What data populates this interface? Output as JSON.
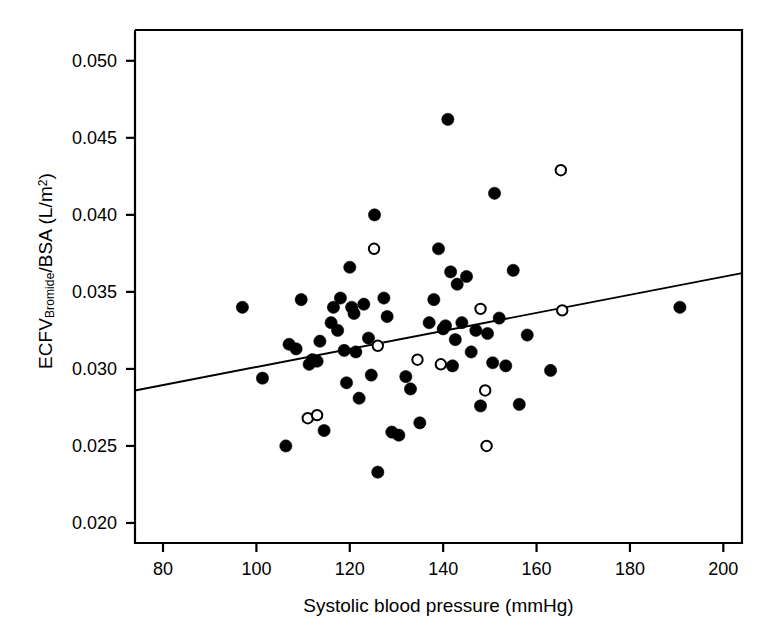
{
  "chart_data": {
    "type": "scatter",
    "title": "",
    "xlabel": "Systolic blood pressure (mmHg)",
    "ylabel_main": "ECFV",
    "ylabel_sub": "Bromide",
    "ylabel_mid": "/BSA (L/m",
    "ylabel_sup": "2",
    "ylabel_end": ")",
    "ylabel_plain": "ECFV_Bromide/BSA (L/m2)",
    "xlim": [
      74,
      204
    ],
    "ylim": [
      0.0187,
      0.052
    ],
    "xticks": [
      80,
      100,
      120,
      140,
      160,
      180,
      200
    ],
    "xticklabels": [
      "80",
      "100",
      "120",
      "140",
      "160",
      "180",
      "200"
    ],
    "yticks": [
      0.02,
      0.025,
      0.03,
      0.035,
      0.04,
      0.045,
      0.05
    ],
    "yticklabels": [
      "0.020",
      "0.025",
      "0.030",
      "0.035",
      "0.040",
      "0.045",
      "0.050"
    ],
    "grid": false,
    "legend": "none",
    "axis_color": "#000000",
    "marker_color": "#000000",
    "line_color": "#000000",
    "series": [
      {
        "name": "filled",
        "marker": "filled-circle",
        "points": [
          [
            97.0,
            0.034
          ],
          [
            101.3,
            0.0294
          ],
          [
            106.3,
            0.025
          ],
          [
            107.0,
            0.0316
          ],
          [
            108.5,
            0.0313
          ],
          [
            109.6,
            0.0345
          ],
          [
            111.3,
            0.0303
          ],
          [
            112.0,
            0.0306
          ],
          [
            113.0,
            0.0305
          ],
          [
            113.6,
            0.0318
          ],
          [
            114.5,
            0.026
          ],
          [
            116.0,
            0.033
          ],
          [
            116.5,
            0.034
          ],
          [
            117.4,
            0.0325
          ],
          [
            118.0,
            0.0346
          ],
          [
            118.8,
            0.0312
          ],
          [
            119.3,
            0.0291
          ],
          [
            120.0,
            0.0366
          ],
          [
            120.4,
            0.034
          ],
          [
            120.9,
            0.0336
          ],
          [
            121.3,
            0.0311
          ],
          [
            122.0,
            0.0281
          ],
          [
            123.0,
            0.0342
          ],
          [
            124.0,
            0.032
          ],
          [
            124.6,
            0.0296
          ],
          [
            125.3,
            0.04
          ],
          [
            126.0,
            0.0233
          ],
          [
            127.3,
            0.0346
          ],
          [
            128.0,
            0.0334
          ],
          [
            129.0,
            0.0259
          ],
          [
            130.5,
            0.0257
          ],
          [
            132.0,
            0.0295
          ],
          [
            133.0,
            0.0287
          ],
          [
            135.0,
            0.0265
          ],
          [
            137.0,
            0.033
          ],
          [
            138.0,
            0.0345
          ],
          [
            139.0,
            0.0378
          ],
          [
            140.0,
            0.0326
          ],
          [
            140.5,
            0.0328
          ],
          [
            141.0,
            0.0462
          ],
          [
            141.6,
            0.0363
          ],
          [
            142.0,
            0.0302
          ],
          [
            142.6,
            0.0319
          ],
          [
            143.0,
            0.0355
          ],
          [
            144.0,
            0.033
          ],
          [
            145.0,
            0.036
          ],
          [
            146.0,
            0.0311
          ],
          [
            147.0,
            0.0325
          ],
          [
            148.0,
            0.0276
          ],
          [
            149.5,
            0.0323
          ],
          [
            150.6,
            0.0304
          ],
          [
            151.0,
            0.0414
          ],
          [
            152.0,
            0.0333
          ],
          [
            153.4,
            0.0302
          ],
          [
            155.0,
            0.0364
          ],
          [
            156.3,
            0.0277
          ],
          [
            158.0,
            0.0322
          ],
          [
            163.0,
            0.0299
          ],
          [
            190.7,
            0.034
          ]
        ]
      },
      {
        "name": "open",
        "marker": "open-circle",
        "points": [
          [
            111.0,
            0.0268
          ],
          [
            113.0,
            0.027
          ],
          [
            125.2,
            0.0378
          ],
          [
            126.0,
            0.0315
          ],
          [
            134.5,
            0.0306
          ],
          [
            139.5,
            0.0303
          ],
          [
            148.0,
            0.0339
          ],
          [
            149.0,
            0.0286
          ],
          [
            149.3,
            0.025
          ],
          [
            165.2,
            0.0429
          ],
          [
            165.5,
            0.0338
          ]
        ]
      }
    ],
    "trendline": {
      "name": "regression-line",
      "x0": 74,
      "y0": 0.0286,
      "x1": 204,
      "y1": 0.03622
    }
  }
}
